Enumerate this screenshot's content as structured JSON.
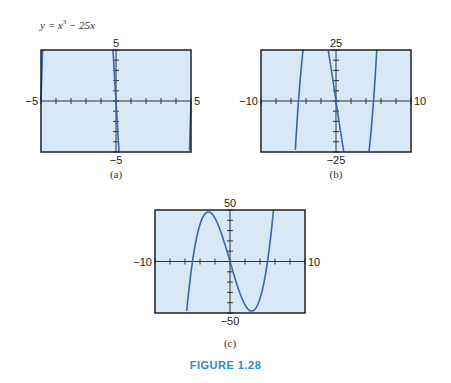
{
  "equation": {
    "prefix": "y = x",
    "exp": "3",
    "suffix": " − 25x"
  },
  "caption": "FIGURE 1.28",
  "colors": {
    "background": "#d8e8f7",
    "curve": "#3a65b0",
    "frame": "#222222",
    "caption": "#2a8bc8"
  },
  "chart_data": [
    {
      "type": "line",
      "panel": "(a)",
      "function": "y = x^3 - 25x",
      "xlim": [
        -5,
        5
      ],
      "ylim": [
        -5,
        5
      ],
      "xtick_count": 10,
      "ytick_count": 10,
      "labels": {
        "left": "−5",
        "right": "5",
        "top": "5",
        "bottom": "−5"
      },
      "grid": false
    },
    {
      "type": "line",
      "panel": "(b)",
      "function": "y = x^3 - 25x",
      "xlim": [
        -10,
        10
      ],
      "ylim": [
        -25,
        25
      ],
      "xtick_count": 10,
      "ytick_count": 10,
      "labels": {
        "left": "−10",
        "right": "10",
        "top": "25",
        "bottom": "−25"
      },
      "grid": false
    },
    {
      "type": "line",
      "panel": "(c)",
      "function": "y = x^3 - 25x",
      "xlim": [
        -10,
        10
      ],
      "ylim": [
        -50,
        50
      ],
      "xtick_count": 10,
      "ytick_count": 10,
      "labels": {
        "left": "−10",
        "right": "10",
        "top": "50",
        "bottom": "−50"
      },
      "grid": false
    }
  ]
}
